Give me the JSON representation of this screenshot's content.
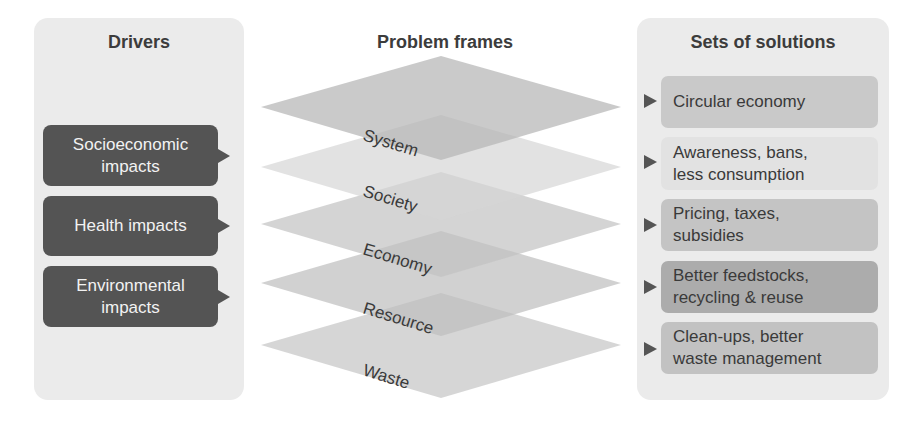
{
  "columns": {
    "drivers": {
      "title": "Drivers",
      "items": [
        {
          "line1": "Socioeconomic",
          "line2": "impacts"
        },
        {
          "line1": "Health impacts",
          "line2": ""
        },
        {
          "line1": "Environmental",
          "line2": "impacts"
        }
      ]
    },
    "problem_frames": {
      "title": "Problem frames",
      "layers": [
        "System",
        "Society",
        "Economy",
        "Resource",
        "Waste"
      ]
    },
    "solutions": {
      "title": "Sets of solutions",
      "items": [
        {
          "line1": "Circular economy",
          "line2": "",
          "color": "#c9c9c9"
        },
        {
          "line1": "Awareness, bans,",
          "line2": "less consumption",
          "color": "#e2e2e2"
        },
        {
          "line1": "Pricing, taxes,",
          "line2": "subsidies",
          "color": "#c4c4c4"
        },
        {
          "line1": "Better feedstocks,",
          "line2": "recycling & reuse",
          "color": "#acacac"
        },
        {
          "line1": "Clean-ups, better",
          "line2": "waste management",
          "color": "#c2c2c2"
        }
      ]
    }
  },
  "colors": {
    "panel_bg": "#ebebeb",
    "driver_box": "#545454",
    "layer_fill": "#bdbdbd",
    "text_dark": "#3a3a3a"
  }
}
